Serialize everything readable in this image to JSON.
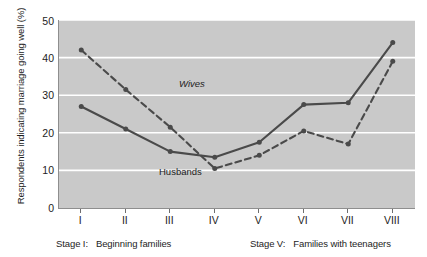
{
  "chart_data": {
    "type": "line",
    "title": "",
    "xlabel": "",
    "ylabel": "Respondents indicating marriage going well (%)",
    "ylim": [
      0,
      50
    ],
    "yticks": [
      0,
      10,
      20,
      30,
      40,
      50
    ],
    "grid": "horizontal",
    "legend_position": "inline-annotation",
    "categories": [
      "I",
      "II",
      "III",
      "IV",
      "V",
      "VI",
      "VII",
      "VIII"
    ],
    "series": [
      {
        "name": "Husbands",
        "style": "solid",
        "color": "#4a4a4a",
        "values": [
          27,
          21,
          15,
          13.5,
          17.5,
          27.5,
          28,
          44
        ]
      },
      {
        "name": "Wives",
        "style": "dashed",
        "color": "#4a4a4a",
        "values": [
          42,
          31.5,
          21.5,
          10.5,
          14,
          20.5,
          17,
          39
        ]
      }
    ],
    "annotations": [
      {
        "text": "Wives",
        "series": "Wives"
      },
      {
        "text": "Husbands",
        "series": "Husbands"
      }
    ]
  },
  "axis": {
    "y_title": "Respondents indicating marriage going well (%)",
    "y_tick_labels": [
      "50",
      "40",
      "30",
      "20",
      "10",
      "0"
    ],
    "x_tick_labels": [
      "I",
      "II",
      "III",
      "IV",
      "V",
      "VI",
      "VII",
      "VIII"
    ]
  },
  "captions": {
    "left": {
      "key": "Stage I:",
      "text": "Beginning families"
    },
    "right": {
      "key": "Stage V:",
      "text": "Families with teenagers"
    }
  },
  "style": {
    "plot_background": "#c9c9c9",
    "gridline_color": "#ffffff",
    "line_color": "#4a4a4a",
    "text_color": "#1d1d1d",
    "page_background": "#ffffff"
  }
}
